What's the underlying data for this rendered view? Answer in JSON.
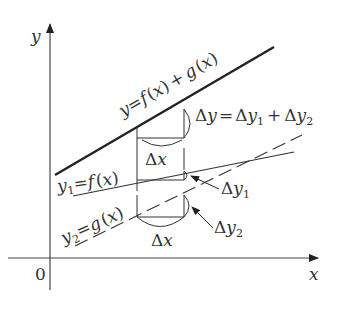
{
  "diagram": {
    "axes": {
      "x_label": "x",
      "y_label": "y",
      "origin_label": "0"
    },
    "lines": [
      {
        "name": "sum",
        "label": "y = f(x) + g(x)",
        "style": "solid-thick"
      },
      {
        "name": "f",
        "label": "y1 = f(x)",
        "style": "solid-thin"
      },
      {
        "name": "g",
        "label": "y2 = g(x)",
        "style": "dashed"
      }
    ],
    "annotations": {
      "delta_y": "Δy = Δy1 + Δy2",
      "delta_y1": "Δy1",
      "delta_y2": "Δy2",
      "delta_x_upper": "Δx",
      "delta_x_lower": "Δx"
    },
    "text": {
      "y": "y",
      "x": "x",
      "zero": "0",
      "eq": "=",
      "f": "f",
      "g": "g",
      "lparen": "(",
      "rparen": ")",
      "plus": "+",
      "delta": "Δ",
      "one": "1",
      "two": "2"
    }
  }
}
